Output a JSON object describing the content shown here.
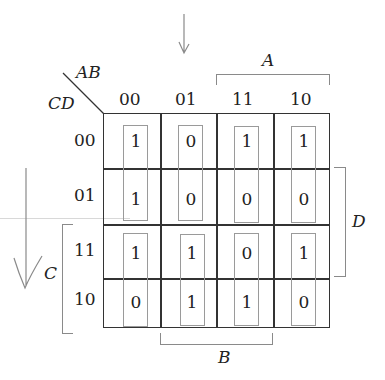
{
  "kmap": {
    "corner_row_var": "AB",
    "corner_col_var": "CD",
    "column_headers": [
      "00",
      "01",
      "11",
      "10"
    ],
    "row_headers": [
      "00",
      "01",
      "11",
      "10"
    ],
    "cells": [
      [
        "1",
        "0",
        "1",
        "1"
      ],
      [
        "1",
        "0",
        "0",
        "0"
      ],
      [
        "1",
        "1",
        "0",
        "1"
      ],
      [
        "0",
        "1",
        "1",
        "0"
      ]
    ],
    "brackets": {
      "A": "A",
      "B": "B",
      "C": "C",
      "D": "D"
    }
  },
  "colors": {
    "grid_line": "#333333",
    "group_box": "#9a9a9a",
    "pencil": "#8a8a8a"
  }
}
